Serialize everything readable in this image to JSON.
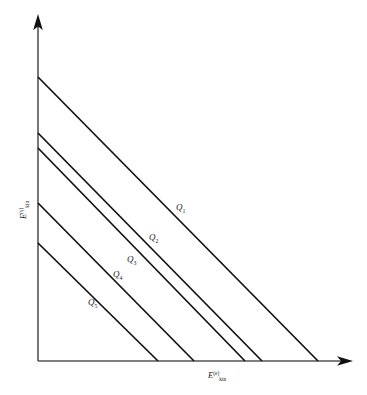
{
  "figure": {
    "name": "kinematic-constraint-plot",
    "background_color": "#ffffff",
    "line_color": "#111111",
    "axis_color": "#555555",
    "axes": {
      "x": {
        "label_base": "E",
        "label_sup": "(e)",
        "label_sub": "kin",
        "origin_px": 38,
        "end_px": 352,
        "baseline_y_px": 361
      },
      "y": {
        "label_base": "E",
        "label_sup": "(γ)",
        "label_sub": "kin",
        "axis_x_px": 38,
        "top_px": 16,
        "bottom_px": 361
      }
    },
    "curves": [
      {
        "label": "Q",
        "sub": "1",
        "y_intercept_px": 77,
        "x_intercept_px": 318,
        "label_x_px": 176,
        "label_y_px": 210
      },
      {
        "label": "Q",
        "sub": "2",
        "y_intercept_px": 133,
        "x_intercept_px": 262,
        "label_x_px": 149,
        "label_y_px": 240
      },
      {
        "label": "Q",
        "sub": "3",
        "y_intercept_px": 148,
        "x_intercept_px": 245,
        "label_x_px": 127,
        "label_y_px": 262
      },
      {
        "label": "Q",
        "sub": "4",
        "y_intercept_px": 203,
        "x_intercept_px": 194,
        "label_x_px": 113,
        "label_y_px": 277
      },
      {
        "label": "Q",
        "sub": "5",
        "y_intercept_px": 243,
        "x_intercept_px": 158,
        "label_x_px": 88,
        "label_y_px": 305
      }
    ]
  }
}
